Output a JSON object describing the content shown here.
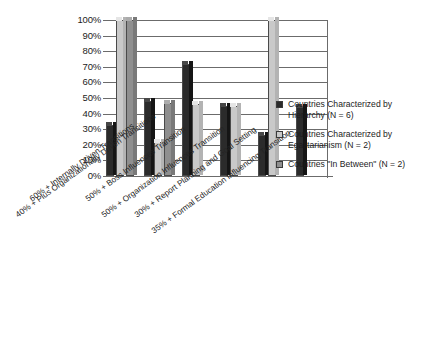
{
  "chart_data": {
    "type": "bar",
    "title": "",
    "subtitle": "",
    "xlabel": "",
    "ylabel": "",
    "ylim": [
      0,
      100
    ],
    "grid": true,
    "legend_position": "right",
    "style": "3d-clustered-column",
    "ytick_labels": [
      "100%",
      "90%",
      "80%",
      "70%",
      "60%",
      "50%",
      "40%",
      "30%",
      "20%",
      "10%",
      "0%"
    ],
    "ytick_values": [
      100,
      90,
      80,
      70,
      60,
      50,
      40,
      30,
      20,
      10,
      0
    ],
    "categories": [
      "60% + Internally Driven Transitions",
      "40% + Plus Organizationally Driven Transitions",
      "50% + Boss Influences Transition",
      "50% + Organization Influences Transition",
      "30% + Report Planning and Goal Setting",
      "35% + Formal Education Influencing Transition"
    ],
    "series": [
      {
        "name": "Countries Characterized by Hierarchy (N = 6)",
        "color": "#2b2b2b",
        "values": [
          33,
          48,
          72,
          45,
          26,
          44
        ]
      },
      {
        "name": "Countries Characterized by Egalitarianism (N = 2)",
        "color": "#c9c9c9",
        "values": [
          100,
          22,
          46,
          45,
          100,
          0
        ]
      },
      {
        "name": "Countries \"In Between\" (N = 2)",
        "color": "#8f8f8f",
        "values": [
          100,
          47,
          0,
          0,
          0,
          0
        ]
      }
    ]
  },
  "legend": {
    "items": [
      {
        "label": "Countries Characterized by\nHierarchy (N = 6)",
        "color": "#2b2b2b",
        "swatch_name": "legend-swatch-hierarchy"
      },
      {
        "label": "Countries Characterized by\nEgalitarianism (N = 2)",
        "color": "#c9c9c9",
        "swatch_name": "legend-swatch-egalitarianism"
      },
      {
        "label": "Countries \"In Between\" (N = 2)",
        "color": "#8f8f8f",
        "swatch_name": "legend-swatch-in-between"
      }
    ]
  }
}
